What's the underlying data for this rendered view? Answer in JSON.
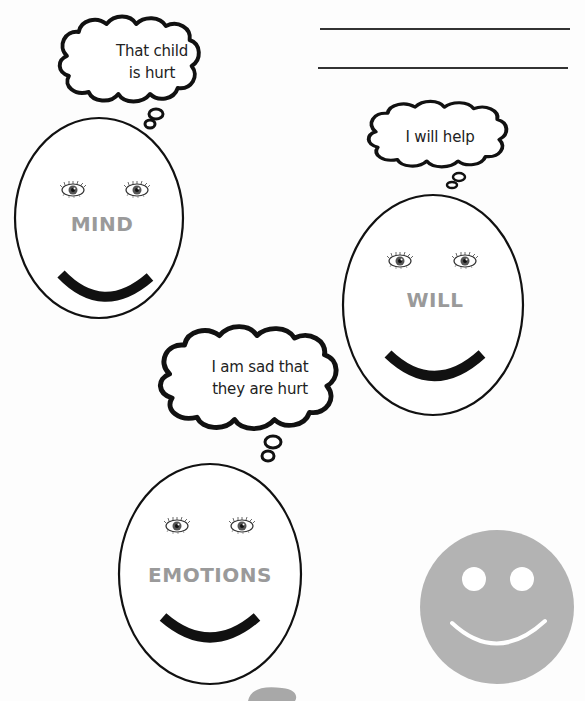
{
  "answer_lines": {
    "count": 2
  },
  "faces": [
    {
      "id": "mind",
      "label": "MIND",
      "thought": [
        "That child",
        "is hurt"
      ]
    },
    {
      "id": "will",
      "label": "WILL",
      "thought": [
        "I will help"
      ]
    },
    {
      "id": "emotions",
      "label": "EMOTIONS",
      "thought": [
        "I am sad that",
        "they are hurt"
      ]
    }
  ],
  "decorations": {
    "smiley_color": "#b3b3b3",
    "label_color": "#9a9a9a",
    "outline_color": "#111111"
  }
}
